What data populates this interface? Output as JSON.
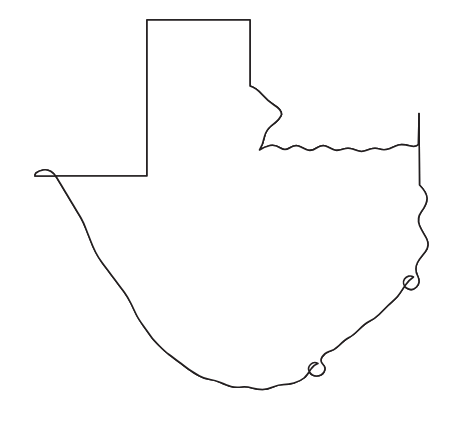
{
  "document": {
    "kind": "outline-map",
    "subject": "Texas",
    "width": 469,
    "height": 423,
    "background_color": "#ffffff"
  },
  "map": {
    "title": "",
    "outline_color": "#231f20",
    "outline_width": 1.6,
    "fill_color": "#ffffff",
    "regions": [
      {
        "id": "panhandle-region",
        "label": "",
        "pattern": "horizontal-lines",
        "pattern_color": "#333333",
        "pattern_spacing_px": 7.5,
        "pattern_line_width": 1.5,
        "fill_color": "#ffffff",
        "outline_color": "#231f20"
      }
    ],
    "borders": [
      {
        "id": "north-panhandle-border",
        "style": "straight"
      },
      {
        "id": "west-panhandle-border",
        "style": "straight"
      },
      {
        "id": "red-river-border",
        "style": "wavy"
      },
      {
        "id": "east-border",
        "style": "straight-and-wavy"
      },
      {
        "id": "gulf-coast-border",
        "style": "wavy"
      },
      {
        "id": "rio-grande-border",
        "style": "wavy"
      },
      {
        "id": "west-straight-border",
        "style": "straight"
      }
    ],
    "labels": [],
    "legend": []
  }
}
